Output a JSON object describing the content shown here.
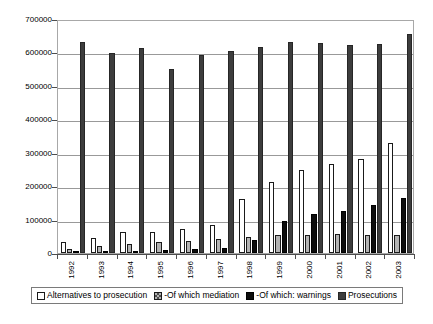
{
  "chart_data": {
    "type": "bar",
    "title": "",
    "subtitle": "",
    "xlabel": "",
    "ylabel": "",
    "grid": true,
    "legend_position": "bottom",
    "ylim": [
      0,
      700000
    ],
    "ytick_step": 100000,
    "ytick_labels": [
      "0",
      "100000",
      "200000",
      "300000",
      "400000",
      "500000",
      "600000",
      "700000"
    ],
    "ytick_values": [
      0,
      100000,
      200000,
      300000,
      400000,
      500000,
      600000,
      700000
    ],
    "categories": [
      "1992",
      "1993",
      "1994",
      "1995",
      "1996",
      "1997",
      "1998",
      "1999",
      "2000",
      "2001",
      "2002",
      "2003"
    ],
    "series": [
      {
        "name": "Alternatives to prosecution",
        "color": "#ffffff",
        "values": [
          33000,
          44000,
          62000,
          64000,
          73000,
          84000,
          163000,
          212000,
          248000,
          267000,
          281000,
          330000
        ]
      },
      {
        "name": "-Of which mediation",
        "color": "#b3b3b3",
        "values": [
          12000,
          20000,
          27000,
          32000,
          37000,
          42000,
          48000,
          53000,
          54000,
          56000,
          54000,
          53000
        ]
      },
      {
        "name": "-Of which: warnings",
        "color": "#0d0d0d",
        "values": [
          3000,
          5000,
          7000,
          9000,
          11000,
          14000,
          38000,
          97000,
          116000,
          127000,
          143000,
          166000
        ]
      },
      {
        "name": "Prosecutions",
        "color": "#3d3d3d",
        "values": [
          632000,
          599000,
          613000,
          551000,
          591000,
          605000,
          617000,
          632000,
          627000,
          622000,
          625000,
          655000
        ]
      }
    ]
  },
  "legend": {
    "items": [
      {
        "label": "Alternatives to prosecution",
        "swatch": "white-square-icon"
      },
      {
        "label": "-Of which mediation",
        "swatch": "hatched-square-icon"
      },
      {
        "label": "-Of which: warnings",
        "swatch": "black-square-icon"
      },
      {
        "label": "Prosecutions",
        "swatch": "dark-gray-square-icon"
      }
    ]
  }
}
